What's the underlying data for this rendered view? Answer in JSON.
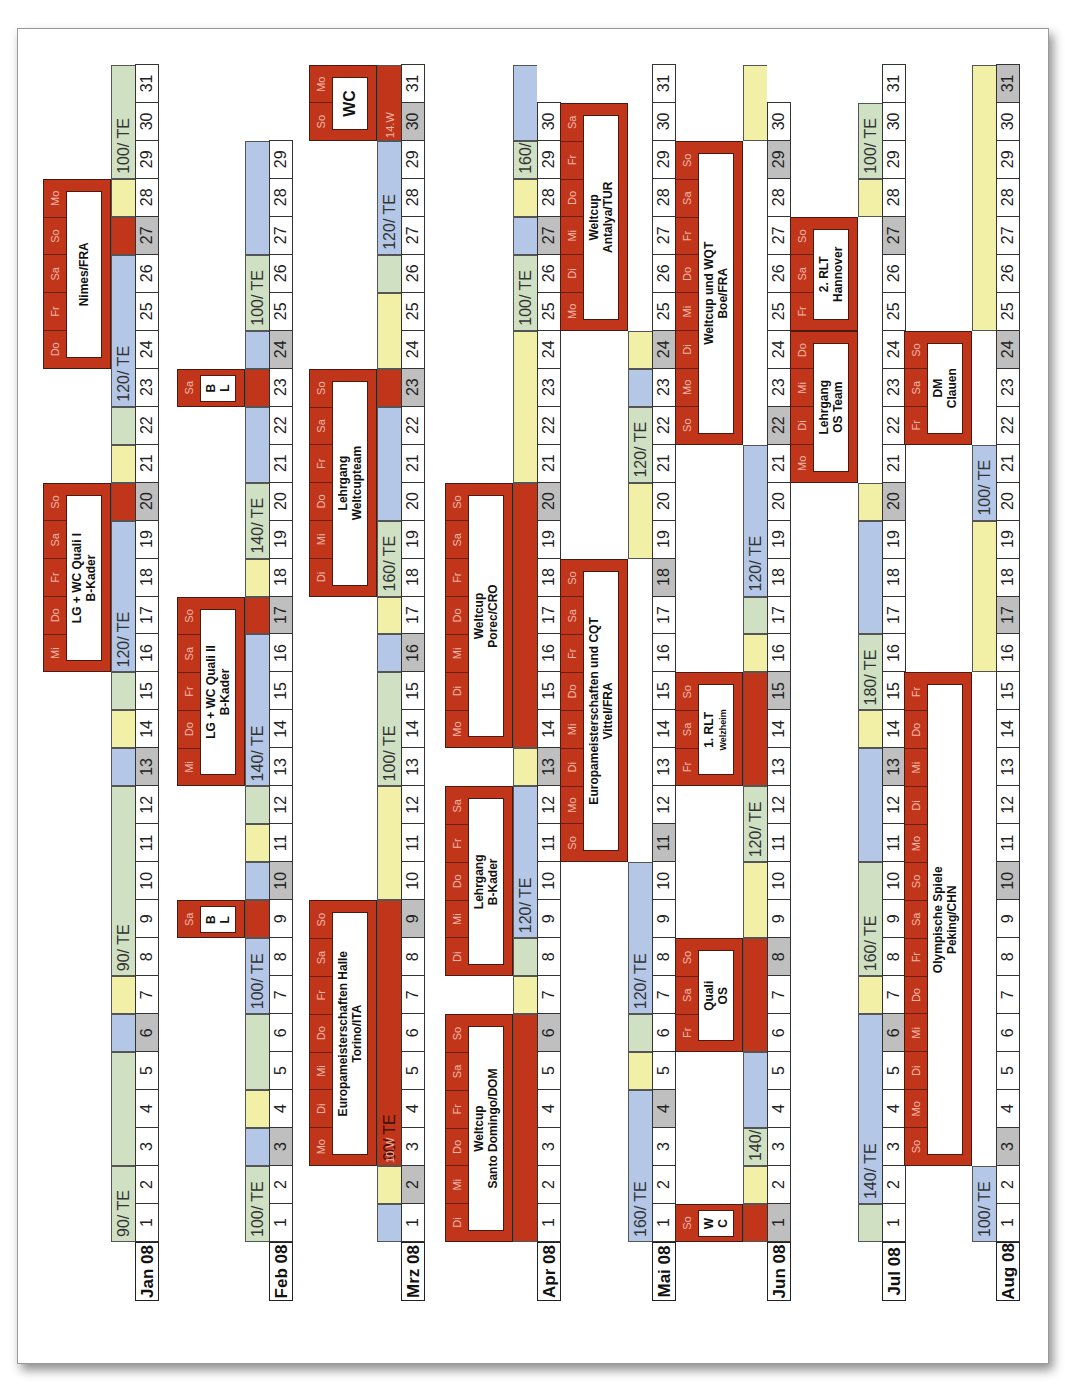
{
  "document": {
    "title": "Trainings- und Wettkampfplan 2008",
    "legend_colors": {
      "green": "#cfe0c3",
      "blue": "#b4c7e7",
      "yellow": "#f2f0a6",
      "event": "#c1361b",
      "sunday": "#bfbfbf"
    }
  },
  "months": [
    {
      "label": "Jan 08",
      "days": 31,
      "sundays": [
        6,
        13,
        20,
        27
      ],
      "bands": [
        {
          "from": 1,
          "to": 2,
          "label": "90/ TE",
          "segments": [
            {
              "from": 1,
              "to": 2,
              "c": "green"
            }
          ]
        },
        {
          "from": 3,
          "to": 31,
          "label": "90/ TE",
          "segments": [
            {
              "from": 3,
              "to": 5,
              "c": "green"
            }
          ]
        }
      ]
    },
    {
      "label": "Feb 08",
      "days": 29,
      "sundays": [
        3,
        10,
        17,
        24
      ]
    },
    {
      "label": "Mrz 08",
      "days": 31,
      "sundays": [
        2,
        9,
        16,
        23,
        30
      ]
    },
    {
      "label": "Apr 08",
      "days": 30,
      "sundays": [
        6,
        13,
        20,
        27
      ]
    },
    {
      "label": "Mai 08",
      "days": 31,
      "sundays": [
        4,
        11,
        18,
        24
      ]
    },
    {
      "label": "Jun 08",
      "days": 30,
      "sundays": [
        1,
        8,
        15,
        22,
        29
      ]
    },
    {
      "label": "Jul 08",
      "days": 31,
      "sundays": [
        6,
        13,
        20,
        27
      ]
    },
    {
      "label": "Aug 08",
      "days": 31,
      "sundays": [
        3,
        10,
        17,
        24,
        31
      ]
    }
  ],
  "rows": {
    "jan": {
      "bands": [
        {
          "from": 1,
          "to": 2,
          "c": "green",
          "label": "90/ TE"
        },
        {
          "from": 3,
          "to": 5,
          "c": "green"
        },
        {
          "from": 6,
          "to": 6,
          "c": "blue"
        },
        {
          "from": 7,
          "to": 7,
          "c": "yellow"
        },
        {
          "from": 8,
          "to": 12,
          "c": "green",
          "label": "90/ TE"
        },
        {
          "from": 13,
          "to": 13,
          "c": "blue"
        },
        {
          "from": 14,
          "to": 14,
          "c": "yellow"
        },
        {
          "from": 15,
          "to": 15,
          "c": "green"
        },
        {
          "from": 16,
          "to": 19,
          "c": "blue",
          "label": "120/ TE"
        },
        {
          "from": 20,
          "to": 20,
          "c": "event"
        },
        {
          "from": 21,
          "to": 21,
          "c": "yellow"
        },
        {
          "from": 22,
          "to": 22,
          "c": "green"
        },
        {
          "from": 23,
          "to": 26,
          "c": "blue",
          "label": "120/ TE"
        },
        {
          "from": 27,
          "to": 27,
          "c": "event"
        },
        {
          "from": 28,
          "to": 28,
          "c": "yellow"
        },
        {
          "from": 29,
          "to": 31,
          "c": "green",
          "label": "100/ TE"
        }
      ],
      "events": [
        {
          "from": 16,
          "to": 20,
          "days": [
            "Mi",
            "Do",
            "Fr",
            "Sa",
            "So"
          ],
          "title": "LG + WC Quali I",
          "subtitle": "B-Kader"
        },
        {
          "from": 24,
          "to": 28,
          "days": [
            "Do",
            "Fr",
            "Sa",
            "So",
            "Mo"
          ],
          "title": "Nimes/FRA",
          "subtitle": ""
        }
      ]
    },
    "feb": {
      "bands": [
        {
          "from": 1,
          "to": 2,
          "c": "green",
          "label": "100/ TE"
        },
        {
          "from": 3,
          "to": 3,
          "c": "blue"
        },
        {
          "from": 4,
          "to": 4,
          "c": "yellow"
        },
        {
          "from": 5,
          "to": 6,
          "c": "green"
        },
        {
          "from": 7,
          "to": 8,
          "c": "blue",
          "label": "100/ TE"
        },
        {
          "from": 9,
          "to": 9,
          "c": "event"
        },
        {
          "from": 10,
          "to": 10,
          "c": "blue"
        },
        {
          "from": 11,
          "to": 11,
          "c": "yellow"
        },
        {
          "from": 12,
          "to": 12,
          "c": "green"
        },
        {
          "from": 13,
          "to": 16,
          "c": "blue",
          "label": "140/ TE"
        },
        {
          "from": 17,
          "to": 17,
          "c": "event"
        },
        {
          "from": 18,
          "to": 18,
          "c": "yellow"
        },
        {
          "from": 19,
          "to": 20,
          "c": "green",
          "label": "140/ TE"
        },
        {
          "from": 21,
          "to": 22,
          "c": "blue"
        },
        {
          "from": 23,
          "to": 23,
          "c": "event"
        },
        {
          "from": 24,
          "to": 24,
          "c": "blue"
        },
        {
          "from": 25,
          "to": 26,
          "c": "green",
          "label": "100/ TE"
        },
        {
          "from": 27,
          "to": 29,
          "c": "blue"
        }
      ],
      "events": [
        {
          "from": 9,
          "to": 9,
          "days": [
            "Sa"
          ],
          "title": "B",
          "subtitle": "L"
        },
        {
          "from": 13,
          "to": 17,
          "days": [
            "Mi",
            "Do",
            "Fr",
            "Sa",
            "So"
          ],
          "title": "LG + WC Quali II",
          "subtitle": "B-Kader"
        },
        {
          "from": 23,
          "to": 23,
          "days": [
            "Sa"
          ],
          "title": "B",
          "subtitle": "L"
        }
      ]
    },
    "mrz": {
      "bands": [
        {
          "from": 1,
          "to": 1,
          "c": "blue"
        },
        {
          "from": 2,
          "to": 2,
          "c": "yellow"
        },
        {
          "from": 3,
          "to": 9,
          "c": "event",
          "label": "90/ TE",
          "note": "10.W"
        },
        {
          "from": 10,
          "to": 12,
          "c": "yellow"
        },
        {
          "from": 13,
          "to": 15,
          "c": "green",
          "label": "100/ TE"
        },
        {
          "from": 16,
          "to": 16,
          "c": "blue"
        },
        {
          "from": 17,
          "to": 17,
          "c": "yellow"
        },
        {
          "from": 18,
          "to": 19,
          "c": "green",
          "label": "160/ TE"
        },
        {
          "from": 20,
          "to": 22,
          "c": "blue"
        },
        {
          "from": 23,
          "to": 23,
          "c": "event"
        },
        {
          "from": 24,
          "to": 25,
          "c": "yellow"
        },
        {
          "from": 26,
          "to": 26,
          "c": "green"
        },
        {
          "from": 27,
          "to": 29,
          "c": "blue",
          "label": "120/ TE"
        },
        {
          "from": 30,
          "to": 31,
          "c": "event",
          "note": "14.W"
        }
      ],
      "events": [
        {
          "from": 3,
          "to": 9,
          "days": [
            "Mo",
            "Di",
            "Mi",
            "Do",
            "Fr",
            "Sa",
            "So"
          ],
          "title": "Europameisterschaften Halle",
          "subtitle": "Torino/ITA"
        },
        {
          "from": 18,
          "to": 23,
          "days": [
            "Di",
            "Mi",
            "Do",
            "Fr",
            "Sa",
            "So"
          ],
          "title": "Lehrgang",
          "subtitle": "Weltcupteam"
        },
        {
          "from": 30,
          "to": 31,
          "days": [
            "So",
            "Mo"
          ],
          "title": "WC",
          "subtitle": ""
        }
      ]
    },
    "apr": {
      "bands": [
        {
          "from": 1,
          "to": 6,
          "c": "event"
        },
        {
          "from": 7,
          "to": 7,
          "c": "yellow"
        },
        {
          "from": 8,
          "to": 8,
          "c": "green"
        },
        {
          "from": 9,
          "to": 12,
          "c": "blue",
          "label": "120/ TE"
        },
        {
          "from": 13,
          "to": 13,
          "c": "yellow"
        },
        {
          "from": 14,
          "to": 20,
          "c": "event"
        },
        {
          "from": 21,
          "to": 24,
          "c": "yellow"
        },
        {
          "from": 25,
          "to": 26,
          "c": "green",
          "label": "100/ TE"
        },
        {
          "from": 27,
          "to": 27,
          "c": "blue"
        },
        {
          "from": 28,
          "to": 28,
          "c": "yellow"
        },
        {
          "from": 29,
          "to": 29,
          "c": "green",
          "label": "160/ TE"
        },
        {
          "from": 30,
          "to": 31,
          "c": "blue"
        }
      ],
      "events": [
        {
          "from": 1,
          "to": 6,
          "days": [
            "Di",
            "Mi",
            "Do",
            "Fr",
            "Sa",
            "So"
          ],
          "title": "Weltcup",
          "subtitle": "Santo Domingo/DOM"
        },
        {
          "from": 8,
          "to": 12,
          "days": [
            "Di",
            "Mi",
            "Do",
            "Fr",
            "Sa"
          ],
          "title": "Lehrgang",
          "subtitle": "B-Kader"
        },
        {
          "from": 14,
          "to": 20,
          "days": [
            "Mo",
            "Di",
            "Mi",
            "Do",
            "Fr",
            "Sa",
            "So"
          ],
          "title": "Weltcup",
          "subtitle": "Porec/CRO"
        }
      ]
    },
    "mai": {
      "bands": [
        {
          "from": 1,
          "to": 4,
          "c": "blue",
          "label": "160/ TE"
        },
        {
          "from": 5,
          "to": 5,
          "c": "yellow"
        },
        {
          "from": 6,
          "to": 6,
          "c": "green"
        },
        {
          "from": 7,
          "to": 10,
          "c": "blue",
          "label": "120/ TE"
        },
        {
          "from": 19,
          "to": 20,
          "c": "yellow"
        },
        {
          "from": 21,
          "to": 22,
          "c": "green",
          "label": "120/ TE"
        },
        {
          "from": 23,
          "to": 23,
          "c": "blue"
        },
        {
          "from": 24,
          "to": 24,
          "c": "yellow"
        }
      ],
      "events": [
        {
          "from": 11,
          "to": 18,
          "days": [
            "So",
            "Mo",
            "Di",
            "Mi",
            "Do",
            "Fr",
            "Sa",
            "So"
          ],
          "title": "Europameisterschaften und CQT",
          "subtitle": "Vittel/FRA"
        },
        {
          "from": 25,
          "to": 30,
          "days": [
            "Mo",
            "Di",
            "Mi",
            "Do",
            "Fr",
            "Sa"
          ],
          "title": "Weltcup",
          "subtitle": "Antalya/TUR"
        }
      ]
    },
    "jun": {
      "bands": [
        {
          "from": 1,
          "to": 1,
          "c": "event"
        },
        {
          "from": 2,
          "to": 2,
          "c": "yellow"
        },
        {
          "from": 3,
          "to": 3,
          "c": "green",
          "label": "140/ TE"
        },
        {
          "from": 4,
          "to": 5,
          "c": "blue"
        },
        {
          "from": 6,
          "to": 8,
          "c": "event"
        },
        {
          "from": 9,
          "to": 10,
          "c": "yellow"
        },
        {
          "from": 11,
          "to": 12,
          "c": "green",
          "label": "120/ TE"
        },
        {
          "from": 13,
          "to": 15,
          "c": "event"
        },
        {
          "from": 16,
          "to": 16,
          "c": "yellow"
        },
        {
          "from": 17,
          "to": 17,
          "c": "green"
        },
        {
          "from": 18,
          "to": 21,
          "c": "blue",
          "label": "120/ TE"
        },
        {
          "from": 30,
          "to": 31,
          "c": "yellow"
        }
      ],
      "events": [
        {
          "from": 1,
          "to": 1,
          "days": [
            "So"
          ],
          "title": "W",
          "subtitle": "C"
        },
        {
          "from": 6,
          "to": 8,
          "days": [
            "Fr",
            "Sa",
            "So"
          ],
          "title": "Quali",
          "subtitle": "OS"
        },
        {
          "from": 13,
          "to": 15,
          "days": [
            "Fr",
            "Sa",
            "So"
          ],
          "title": "1. RLT",
          "subtitle": "Welzheim"
        },
        {
          "from": 22,
          "to": 29,
          "days": [
            "So",
            "Mo",
            "Di",
            "Mi",
            "Do",
            "Fr",
            "Sa",
            "So"
          ],
          "title": "Weltcup und WQT",
          "subtitle": "Boe/FRA"
        }
      ]
    },
    "jul": {
      "bands": [
        {
          "from": 1,
          "to": 1,
          "c": "green"
        },
        {
          "from": 2,
          "to": 6,
          "c": "blue",
          "label": "140/ TE"
        },
        {
          "from": 7,
          "to": 7,
          "c": "yellow"
        },
        {
          "from": 8,
          "to": 10,
          "c": "green",
          "label": "160/ TE"
        },
        {
          "from": 11,
          "to": 13,
          "c": "blue"
        },
        {
          "from": 14,
          "to": 14,
          "c": "yellow"
        },
        {
          "from": 15,
          "to": 16,
          "c": "green",
          "label": "180/ TE"
        },
        {
          "from": 17,
          "to": 19,
          "c": "blue"
        },
        {
          "from": 20,
          "to": 20,
          "c": "yellow"
        },
        {
          "from": 28,
          "to": 28,
          "c": "yellow"
        },
        {
          "from": 29,
          "to": 30,
          "c": "green",
          "label": "100/ TE"
        }
      ],
      "events": [
        {
          "from": 21,
          "to": 24,
          "days": [
            "Mo",
            "Di",
            "Mi",
            "Do"
          ],
          "title": "Lehrgang",
          "subtitle": "OS Team"
        },
        {
          "from": 25,
          "to": 27,
          "days": [
            "Fr",
            "Sa",
            "So"
          ],
          "title": "2. RLT",
          "subtitle": "Hannover"
        }
      ]
    },
    "aug": {
      "bands": [
        {
          "from": 1,
          "to": 2,
          "c": "blue",
          "label": "100/ TE"
        },
        {
          "from": 16,
          "to": 19,
          "c": "yellow"
        },
        {
          "from": 20,
          "to": 21,
          "c": "blue",
          "label": "100/ TE"
        },
        {
          "from": 25,
          "to": 31,
          "c": "yellow"
        }
      ],
      "events": [
        {
          "from": 3,
          "to": 15,
          "days": [
            "So",
            "Mo",
            "Di",
            "Mi",
            "Do",
            "Fr",
            "Sa",
            "So",
            "Mo",
            "Di",
            "Mi",
            "Do",
            "Fr"
          ],
          "title": "Olympische Spiele",
          "subtitle": "Peking/CHN"
        },
        {
          "from": 22,
          "to": 24,
          "days": [
            "Fr",
            "Sa",
            "So"
          ],
          "title": "DM",
          "subtitle": "Clauen"
        }
      ]
    }
  },
  "row_keys": [
    "jan",
    "feb",
    "mrz",
    "apr",
    "mai",
    "jun",
    "jul",
    "aug"
  ]
}
